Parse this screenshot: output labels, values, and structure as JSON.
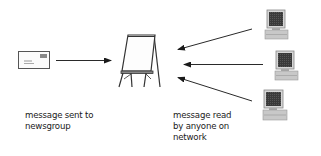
{
  "diagram": {
    "title": "",
    "nodes": [
      {
        "id": "envelope",
        "type": "message-envelope-icon",
        "label": ""
      },
      {
        "id": "easel",
        "type": "newsgroup-easel-board-icon",
        "label": ""
      },
      {
        "id": "computer-1",
        "type": "computer-icon",
        "label": ""
      },
      {
        "id": "computer-2",
        "type": "computer-icon",
        "label": ""
      },
      {
        "id": "computer-3",
        "type": "computer-icon",
        "label": ""
      }
    ],
    "edges": [
      {
        "from": "envelope",
        "to": "easel"
      },
      {
        "from": "computer-1",
        "to": "easel"
      },
      {
        "from": "computer-2",
        "to": "easel"
      },
      {
        "from": "computer-3",
        "to": "easel"
      }
    ],
    "captions": {
      "left": {
        "line1": "message sent to",
        "line2": "newsgroup"
      },
      "right": {
        "line1": "message read",
        "line2": "by anyone on",
        "line3": "network"
      }
    },
    "colors": {
      "line": "#2a2a2a",
      "screen": "#3a3a3a",
      "case": "#c8c8c8",
      "background": "#ffffff"
    }
  }
}
